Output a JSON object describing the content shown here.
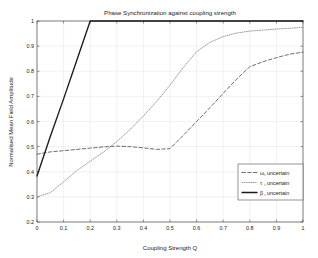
{
  "chart_data": {
    "type": "line",
    "title": "Phase Synchronization against coupling strength",
    "xlabel": "Coupling Strength Q",
    "ylabel": "Normalised Mean Field Amplitude",
    "xlim": [
      0,
      1
    ],
    "ylim": [
      0.2,
      1
    ],
    "grid": true,
    "legend_position": "lower-right",
    "xticks": [
      "0",
      "0.1",
      "0.2",
      "0.3",
      "0.4",
      "0.5",
      "0.6",
      "0.7",
      "0.8",
      "0.9",
      "1"
    ],
    "xtick_values": [
      0,
      0.1,
      0.2,
      0.3,
      0.4,
      0.5,
      0.6,
      0.7,
      0.8,
      0.9,
      1
    ],
    "yticks": [
      "0.2",
      "0.3",
      "0.4",
      "0.5",
      "0.6",
      "0.7",
      "0.8",
      "0.9",
      "1"
    ],
    "ytick_values": [
      0.2,
      0.3,
      0.4,
      0.5,
      0.6,
      0.7,
      0.8,
      0.9,
      1
    ],
    "x": [
      0,
      0.05,
      0.1,
      0.15,
      0.2,
      0.25,
      0.3,
      0.35,
      0.4,
      0.45,
      0.5,
      0.55,
      0.6,
      0.65,
      0.7,
      0.75,
      0.8,
      0.85,
      0.9,
      0.95,
      1
    ],
    "series": [
      {
        "name": "omega-i uncertain",
        "legend_symbol": "ω",
        "legend_subscript": "i",
        "legend_suffix": " uncertain",
        "style": "dashed",
        "color": "#555555",
        "values": [
          0.47,
          0.479,
          0.484,
          0.489,
          0.494,
          0.499,
          0.502,
          0.5,
          0.495,
          0.489,
          0.492,
          0.545,
          0.6,
          0.655,
          0.712,
          0.768,
          0.818,
          0.838,
          0.854,
          0.868,
          0.876
        ]
      },
      {
        "name": "tau-i uncertain",
        "legend_symbol": "τ",
        "legend_subscript": "i",
        "legend_suffix": " uncertain",
        "style": "dotted",
        "color": "#8a8a8a",
        "values": [
          0.3,
          0.317,
          0.36,
          0.405,
          0.442,
          0.478,
          0.52,
          0.568,
          0.622,
          0.68,
          0.745,
          0.815,
          0.878,
          0.915,
          0.938,
          0.952,
          0.96,
          0.964,
          0.968,
          0.971,
          0.975
        ]
      },
      {
        "name": "beta-i uncertain",
        "legend_symbol": "β",
        "legend_subscript": "i",
        "legend_suffix": " uncertain",
        "style": "solid",
        "color": "#1a1a1a",
        "values": [
          0.383,
          0.54,
          0.69,
          0.845,
          1.0,
          1.0,
          1.0,
          1.0,
          1.0,
          1.0,
          1.0,
          1.0,
          1.0,
          1.0,
          1.0,
          1.0,
          1.0,
          1.0,
          1.0,
          1.0,
          1.0
        ]
      }
    ]
  },
  "legend": {
    "entries": [
      {
        "symbol": "ω",
        "subscript": "i",
        "label": " uncertain"
      },
      {
        "symbol": "τ",
        "subscript": "i",
        "label": " uncertain"
      },
      {
        "symbol": "β",
        "subscript": "i",
        "label": " uncertain"
      }
    ]
  },
  "colors": {
    "axis": "#4d4d4d",
    "grid": "#e2e2e2",
    "background": "#ffffff",
    "text": "#1a1a1a"
  }
}
